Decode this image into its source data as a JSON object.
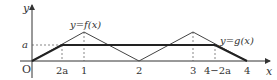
{
  "diagram": {
    "axes": {
      "x_label": "x",
      "y_label": "y",
      "origin_label": "O"
    },
    "x_ticks": [
      "2a",
      "1",
      "2",
      "3",
      "4−2a",
      "4"
    ],
    "y_ticks": [
      "a"
    ],
    "curves": [
      {
        "name": "f",
        "label": "y=f(x)",
        "description": "triangular wave: 0 at x=0, peak at x=1, 0 at x=2, peak at x=3, 0 at x=4"
      },
      {
        "name": "g",
        "label": "y=g(x)",
        "description": "rises from O to a at x=2a, constant a until x=4-2a, then falls to 0 at x=4"
      }
    ],
    "colors": {
      "f_line": "#444444",
      "g_line": "#222222",
      "axis": "#333333",
      "dashed": "#555555"
    }
  }
}
